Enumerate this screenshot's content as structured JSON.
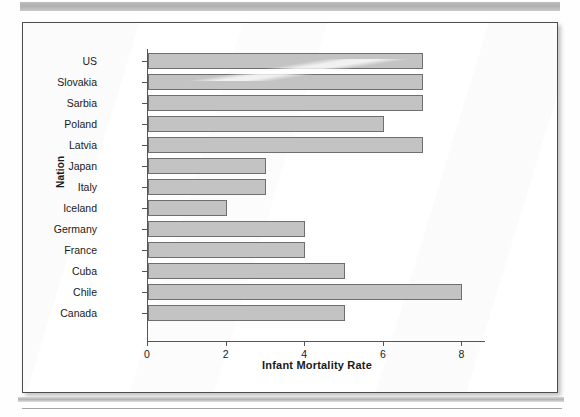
{
  "page": {
    "top_rule": "scan-rule-top",
    "bottom_rule": "scan-rule-bottom"
  },
  "chart_data": {
    "type": "bar",
    "orientation": "horizontal",
    "title": "",
    "xlabel": "Infant Mortality Rate",
    "ylabel": "Nation",
    "categories": [
      "US",
      "Slovakia",
      "Sarbia",
      "Poland",
      "Latvia",
      "Japan",
      "Italy",
      "Iceland",
      "Germany",
      "France",
      "Cuba",
      "Chile",
      "Canada"
    ],
    "values": [
      7,
      7,
      7,
      6,
      7,
      3,
      3,
      2,
      4,
      4,
      5,
      8,
      5
    ],
    "xticks": [
      0,
      2,
      4,
      6,
      8
    ],
    "xlim": [
      0,
      8.6
    ],
    "grid": false,
    "legend": false,
    "bar_fill": "#c3c3c3",
    "bar_edge": "#6f6f6f",
    "axis_color": "#555555",
    "text_color": "#1a1a1a"
  }
}
